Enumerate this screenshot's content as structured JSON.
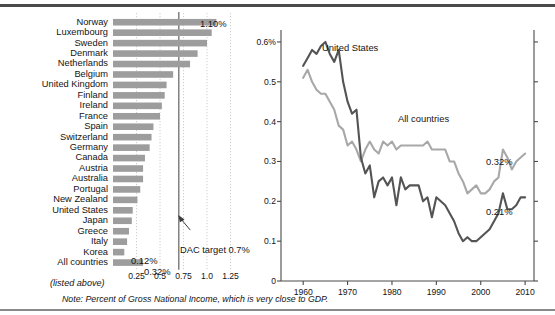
{
  "figure": {
    "note": "Note: Percent of Gross National Income, which is very close to GDP.",
    "bar_panel_subcaption": "(listed above)"
  },
  "annotations": {
    "dac_target": "DAC target 0.7%",
    "norway_value": "1.10%",
    "korea_value": "0.12%",
    "all_countries_value": "0.32%",
    "line_us_end_value": "0.21%",
    "line_all_end_value": "0.32%"
  },
  "colors": {
    "bar_fill": "#9d9d9d",
    "line_united_states": "#545454",
    "line_all_countries": "#a8a8a8",
    "axis": "#4a4a4a",
    "grid": "#c8c8c8",
    "target_line": "#6e6e6e"
  },
  "chart_data": [
    {
      "type": "bar",
      "title": "",
      "xlabel": "",
      "ylabel": "",
      "orientation": "horizontal",
      "xlim": [
        0,
        1.35
      ],
      "xticks": [
        0.25,
        0.5,
        0.75,
        1.0,
        1.25
      ],
      "xticklabels": [
        "0.25",
        "0.5",
        "0.75",
        "1.0",
        "1.25"
      ],
      "grid": true,
      "target_value": 0.7,
      "categories": [
        "Norway",
        "Luxembourg",
        "Sweden",
        "Denmark",
        "Netherlands",
        "Belgium",
        "United Kingdom",
        "Finland",
        "Ireland",
        "France",
        "Spain",
        "Switzerland",
        "Germany",
        "Canada",
        "Austria",
        "Australia",
        "Portugal",
        "New Zealand",
        "United States",
        "Japan",
        "Greece",
        "Italy",
        "Korea",
        "All countries"
      ],
      "values": [
        1.1,
        1.05,
        1.0,
        0.9,
        0.82,
        0.64,
        0.57,
        0.55,
        0.52,
        0.5,
        0.43,
        0.41,
        0.39,
        0.34,
        0.32,
        0.32,
        0.29,
        0.26,
        0.21,
        0.2,
        0.17,
        0.15,
        0.12,
        0.32
      ]
    },
    {
      "type": "line",
      "title": "",
      "xlabel": "",
      "ylabel": "",
      "xlim": [
        1955,
        2012
      ],
      "ylim": [
        0,
        0.63
      ],
      "xticks": [
        1960,
        1970,
        1980,
        1990,
        2000,
        2010
      ],
      "xticklabels": [
        "1960",
        "1970",
        "1980",
        "1990",
        "2000",
        "2010"
      ],
      "yticks": [
        0,
        0.1,
        0.2,
        0.3,
        0.4,
        0.5,
        0.6
      ],
      "yticklabels": [
        "0",
        "0.1",
        "0.2",
        "0.3",
        "0.4",
        "0.5",
        "0.6%"
      ],
      "legend_position": "inline-labels",
      "series": [
        {
          "name": "United States",
          "x": [
            1960,
            1961,
            1962,
            1963,
            1964,
            1965,
            1966,
            1967,
            1968,
            1969,
            1970,
            1971,
            1972,
            1973,
            1974,
            1975,
            1976,
            1977,
            1978,
            1979,
            1980,
            1981,
            1982,
            1983,
            1984,
            1985,
            1986,
            1987,
            1988,
            1989,
            1990,
            1991,
            1992,
            1993,
            1994,
            1995,
            1996,
            1997,
            1998,
            1999,
            2000,
            2001,
            2002,
            2003,
            2004,
            2005,
            2006,
            2007,
            2008,
            2009,
            2010
          ],
          "y": [
            0.54,
            0.56,
            0.58,
            0.57,
            0.59,
            0.6,
            0.57,
            0.55,
            0.58,
            0.5,
            0.45,
            0.42,
            0.43,
            0.31,
            0.27,
            0.29,
            0.21,
            0.25,
            0.26,
            0.24,
            0.26,
            0.19,
            0.26,
            0.23,
            0.24,
            0.24,
            0.24,
            0.2,
            0.21,
            0.16,
            0.21,
            0.2,
            0.19,
            0.17,
            0.15,
            0.12,
            0.1,
            0.11,
            0.1,
            0.1,
            0.11,
            0.12,
            0.13,
            0.15,
            0.17,
            0.22,
            0.18,
            0.18,
            0.19,
            0.21,
            0.21
          ]
        },
        {
          "name": "All countries",
          "x": [
            1960,
            1961,
            1962,
            1963,
            1964,
            1965,
            1966,
            1967,
            1968,
            1969,
            1970,
            1971,
            1972,
            1973,
            1974,
            1975,
            1976,
            1977,
            1978,
            1979,
            1980,
            1981,
            1982,
            1983,
            1984,
            1985,
            1986,
            1987,
            1988,
            1989,
            1990,
            1991,
            1992,
            1993,
            1994,
            1995,
            1996,
            1997,
            1998,
            1999,
            2000,
            2001,
            2002,
            2003,
            2004,
            2005,
            2006,
            2007,
            2008,
            2009,
            2010
          ],
          "y": [
            0.51,
            0.53,
            0.5,
            0.48,
            0.47,
            0.47,
            0.45,
            0.43,
            0.39,
            0.38,
            0.34,
            0.35,
            0.33,
            0.3,
            0.33,
            0.35,
            0.33,
            0.32,
            0.35,
            0.34,
            0.35,
            0.33,
            0.34,
            0.34,
            0.34,
            0.34,
            0.34,
            0.34,
            0.35,
            0.33,
            0.33,
            0.33,
            0.33,
            0.3,
            0.3,
            0.27,
            0.25,
            0.22,
            0.23,
            0.24,
            0.22,
            0.22,
            0.23,
            0.25,
            0.26,
            0.33,
            0.31,
            0.28,
            0.3,
            0.31,
            0.32
          ]
        }
      ]
    }
  ]
}
